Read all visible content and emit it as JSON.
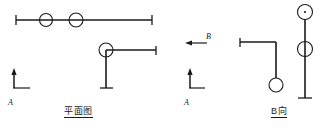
{
  "drawing": {
    "title_plan": "平面图",
    "title_bview": "B向",
    "section_mark_a_left": "A",
    "section_mark_a_mid": "A",
    "section_mark_b": "B",
    "line_color": "#1a1a1a",
    "background_color": "#ffffff"
  },
  "geometry": {
    "plan_view": {
      "top_rail": {
        "x1": 16,
        "y1": 20,
        "x2": 152,
        "y2": 20,
        "end_cap_left": true,
        "end_cap_right": true,
        "circles": [
          {
            "cx": 46,
            "cy": 20,
            "r": 6.5,
            "center_dot": false
          },
          {
            "cx": 76,
            "cy": 20,
            "r": 7.0,
            "center_dot": false
          }
        ]
      },
      "lower_assembly": {
        "circle": {
          "cx": 106,
          "cy": 50,
          "r": 7.0,
          "center_dot": false
        },
        "horizontal": {
          "x1": 106,
          "y1": 50,
          "x2": 156,
          "y2": 50,
          "end_cap_right": true
        },
        "vertical": {
          "x1": 106,
          "y1": 50,
          "x2": 106,
          "y2": 88,
          "end_cap_bottom": true
        }
      },
      "arrow_a_left": {
        "vertical": {
          "x1": 14,
          "y1": 70,
          "x2": 14,
          "y2": 88
        },
        "horizontal": {
          "x1": 14,
          "y1": 88,
          "x2": 30,
          "y2": 88
        },
        "arrow_dir": "up"
      }
    },
    "section_markers": {
      "arrow_b": {
        "horizontal": {
          "x1": 206,
          "y1": 43,
          "x2": 186,
          "y2": 43
        },
        "arrow_dir": "left"
      },
      "arrow_a_mid": {
        "vertical": {
          "x1": 190,
          "y1": 70,
          "x2": 190,
          "y2": 88
        },
        "horizontal": {
          "x1": 190,
          "y1": 88,
          "x2": 204,
          "y2": 88
        },
        "arrow_dir": "up"
      }
    },
    "b_view": {
      "elbow": {
        "horizontal": {
          "x1": 240,
          "y1": 42,
          "x2": 276,
          "y2": 42,
          "end_cap_left": true
        },
        "vertical": {
          "x1": 276,
          "y1": 42,
          "x2": 276,
          "y2": 78
        },
        "circle": {
          "cx": 276,
          "cy": 85,
          "r": 7.0,
          "center_dot": false
        }
      },
      "mast": {
        "vertical": {
          "x1": 305,
          "y1": 12,
          "x2": 305,
          "y2": 98,
          "end_cap_bottom": true
        },
        "circles": [
          {
            "cx": 305,
            "cy": 12,
            "r": 7.5,
            "center_dot": true
          },
          {
            "cx": 305,
            "cy": 49,
            "r": 7.5,
            "center_dot": false
          }
        ]
      }
    }
  }
}
